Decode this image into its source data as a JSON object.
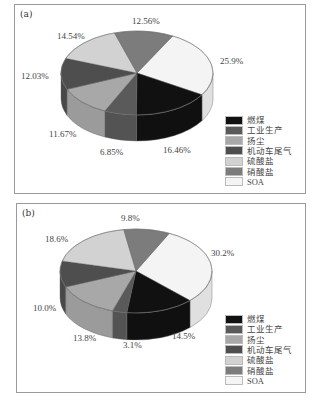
{
  "legend": {
    "items": [
      {
        "label": "燃煤",
        "color": "#111111"
      },
      {
        "label": "工业生产",
        "color": "#5a5a5a"
      },
      {
        "label": "扬尘",
        "color": "#a8a8a8"
      },
      {
        "label": "机动车尾气",
        "color": "#4e4e4e"
      },
      {
        "label": "硫酸盐",
        "color": "#d2d2d2"
      },
      {
        "label": "硝酸盐",
        "color": "#7c7c7c"
      },
      {
        "label": "SOA",
        "color": "#f4f4f4"
      }
    ]
  },
  "chart_data": [
    {
      "type": "pie",
      "title": "(a)",
      "categories": [
        "燃煤",
        "工业生产",
        "扬尘",
        "机动车尾气",
        "硫酸盐",
        "硝酸盐",
        "SOA"
      ],
      "values": [
        16.46,
        6.85,
        11.67,
        12.03,
        14.54,
        12.56,
        25.9
      ],
      "labels": [
        "16.46%",
        "6.85%",
        "11.67%",
        "12.03%",
        "14.54%",
        "12.56%",
        "25.9%"
      ],
      "style": "3d-exploded-none",
      "legend_position": "lower right"
    },
    {
      "type": "pie",
      "title": "(b)",
      "categories": [
        "燃煤",
        "工业生产",
        "扬尘",
        "机动车尾气",
        "硫酸盐",
        "硝酸盐",
        "SOA"
      ],
      "values": [
        14.5,
        3.1,
        13.8,
        10.0,
        18.6,
        9.8,
        30.2
      ],
      "labels": [
        "14.5%",
        "3.1%",
        "13.8%",
        "10.0%",
        "18.6%",
        "9.8%",
        "30.2%"
      ],
      "style": "3d-exploded-none",
      "legend_position": "lower right"
    }
  ],
  "panels": [
    {
      "label": "(a)",
      "label_positions": [
        {
          "text": "16.46%",
          "x": 148,
          "y": 140
        },
        {
          "text": "6.85%",
          "x": 85,
          "y": 142
        },
        {
          "text": "11.67%",
          "x": 34,
          "y": 124
        },
        {
          "text": "12.03%",
          "x": 6,
          "y": 66
        },
        {
          "text": "14.54%",
          "x": 42,
          "y": 26
        },
        {
          "text": "12.56%",
          "x": 117,
          "y": 11
        },
        {
          "text": "25.9%",
          "x": 205,
          "y": 51
        }
      ]
    },
    {
      "label": "(b)",
      "label_positions": [
        {
          "text": "14.5%",
          "x": 155,
          "y": 127
        },
        {
          "text": "3.1%",
          "x": 106,
          "y": 136
        },
        {
          "text": "13.8%",
          "x": 56,
          "y": 129
        },
        {
          "text": "10.0%",
          "x": 16,
          "y": 99
        },
        {
          "text": "18.6%",
          "x": 28,
          "y": 30
        },
        {
          "text": "9.8%",
          "x": 104,
          "y": 9
        },
        {
          "text": "30.2%",
          "x": 194,
          "y": 44
        }
      ]
    }
  ]
}
